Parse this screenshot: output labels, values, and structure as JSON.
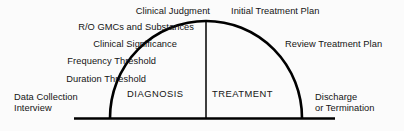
{
  "diagram": {
    "type": "arch-flow",
    "colors": {
      "background": "#fbfbfb",
      "stroke": "#000000",
      "text": "#141414"
    },
    "zones": [
      {
        "id": "diagnosis",
        "label": "DIAGNOSIS",
        "side": "left"
      },
      {
        "id": "treatment",
        "label": "TREATMENT",
        "side": "right"
      }
    ],
    "stages_left": [
      {
        "id": "clinical-judgment",
        "label": "Clinical Judgment"
      },
      {
        "id": "ro-gmcs-substances",
        "label": "R/O GMCs and Substances"
      },
      {
        "id": "clinical-significance",
        "label": "Clinical Significance"
      },
      {
        "id": "frequency-threshold",
        "label": "Frequency Threshold"
      },
      {
        "id": "duration-threshold",
        "label": "Duration Threshold"
      },
      {
        "id": "data-collection",
        "label": "Data Collection\nInterview"
      }
    ],
    "stages_right": [
      {
        "id": "initial-treatment-plan",
        "label": "Initial Treatment Plan"
      },
      {
        "id": "review-treatment-plan",
        "label": "Review Treatment Plan"
      },
      {
        "id": "discharge-termination",
        "label": "Discharge\nor Termination"
      }
    ],
    "geometry": {
      "arch_left_foot_x": 110,
      "arch_right_foot_x": 302,
      "arch_apex_x": 206,
      "arch_apex_y": 21,
      "baseline_y": 118,
      "baseline_start_x": 74,
      "baseline_end_x": 335
    }
  }
}
